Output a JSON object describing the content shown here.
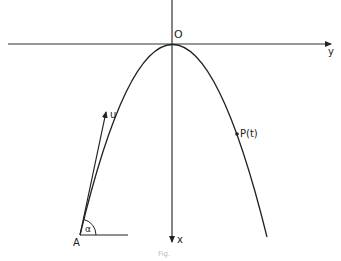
{
  "diagram": {
    "type": "projectile-parabola",
    "labels": {
      "origin": "O",
      "y_axis": "y",
      "x_axis": "x",
      "velocity": "u",
      "point": "P(t)",
      "launch_point": "A",
      "angle": "α"
    },
    "caption": "Fig.",
    "colors": {
      "stroke": "#222222",
      "background": "#ffffff"
    }
  }
}
